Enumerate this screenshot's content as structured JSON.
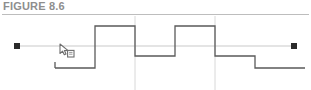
{
  "figure": {
    "label": "FIGURE 8.6"
  },
  "canvas": {
    "name": "drawing-canvas",
    "background_color": "#ffffff",
    "stroke_color": "#5a5a5a",
    "guide_color": "#c9c9c9",
    "gridline_color": "#d8d8d8",
    "grip_color": "#2b2b2b",
    "stroke_width": 1.2
  },
  "guide_line": {
    "label": "construction-guide-line",
    "x1": 17,
    "x2": 294,
    "y": 46,
    "color": "#c9c9c9",
    "endpoints": [
      {
        "label": "start-grip",
        "x": 17,
        "y": 46
      },
      {
        "label": "end-grip",
        "x": 294,
        "y": 46
      }
    ]
  },
  "gridlines": [
    {
      "label": "vertical-gridline-1",
      "x": 135
    },
    {
      "label": "vertical-gridline-2",
      "x": 215
    }
  ],
  "waveform": {
    "label": "stepped-square-wave-polyline",
    "levels": {
      "baseline_y": 68,
      "mid_y": 56,
      "peak_y": 26
    },
    "points": [
      [
        55,
        68
      ],
      [
        55,
        68
      ],
      [
        95,
        68
      ],
      [
        95,
        26
      ],
      [
        135,
        26
      ],
      [
        135,
        56
      ],
      [
        175,
        56
      ],
      [
        175,
        26
      ],
      [
        215,
        26
      ],
      [
        215,
        56
      ],
      [
        255,
        56
      ],
      [
        255,
        68
      ],
      [
        305,
        68
      ]
    ],
    "segments": [
      {
        "label": "baseline-left",
        "y": 68,
        "x1": 55,
        "x2": 95
      },
      {
        "label": "pulse-1-top",
        "y": 26,
        "x1": 95,
        "x2": 135
      },
      {
        "label": "mid-level-1",
        "y": 56,
        "x1": 135,
        "x2": 175
      },
      {
        "label": "pulse-2-top",
        "y": 26,
        "x1": 175,
        "x2": 215
      },
      {
        "label": "mid-level-2",
        "y": 56,
        "x1": 215,
        "x2": 255
      },
      {
        "label": "baseline-right",
        "y": 68,
        "x1": 255,
        "x2": 305
      }
    ]
  },
  "cursor": {
    "label": "drag-copy-cursor",
    "icon": "arrow-pointer-copy-icon",
    "x": 59,
    "y": 43,
    "color": "#6e6e6e"
  }
}
